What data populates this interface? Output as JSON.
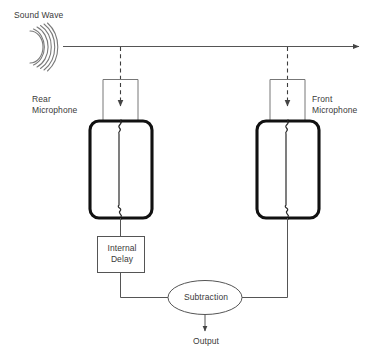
{
  "diagram": {
    "labels": {
      "sound_wave": "Sound Wave",
      "rear_microphone": "Rear\nMicrophone",
      "front_microphone": "Front\nMicrophone",
      "internal_delay": "Internal\nDelay",
      "subtraction": "Subtraction",
      "output": "Output"
    },
    "colors": {
      "background": "#ffffff",
      "text": "#3a3a3a",
      "thin_line": "#555555",
      "thick_line": "#111111",
      "wave": "#777777"
    },
    "nodes": [
      {
        "id": "sound-wave",
        "type": "wave",
        "label": "Sound Wave",
        "arcs": 6
      },
      {
        "id": "rear-microphone",
        "type": "microphone",
        "label": "Rear Microphone"
      },
      {
        "id": "front-microphone",
        "type": "microphone",
        "label": "Front Microphone"
      },
      {
        "id": "internal-delay",
        "type": "box",
        "label": "Internal Delay"
      },
      {
        "id": "subtraction",
        "type": "ellipse",
        "label": "Subtraction"
      },
      {
        "id": "output",
        "type": "terminal",
        "label": "Output"
      }
    ],
    "edges": [
      {
        "from": "sound-wave",
        "to": "propagation-arrow",
        "style": "solid-arrow"
      },
      {
        "from": "propagation-arrow",
        "to": "rear-microphone",
        "style": "dashed-arrow"
      },
      {
        "from": "propagation-arrow",
        "to": "front-microphone",
        "style": "dashed-arrow"
      },
      {
        "from": "rear-microphone",
        "to": "internal-delay",
        "style": "solid"
      },
      {
        "from": "internal-delay",
        "to": "subtraction",
        "style": "solid"
      },
      {
        "from": "front-microphone",
        "to": "subtraction",
        "style": "solid"
      },
      {
        "from": "subtraction",
        "to": "output",
        "style": "solid-arrow"
      }
    ]
  }
}
